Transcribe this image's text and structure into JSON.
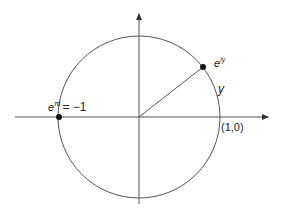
{
  "diagram": {
    "type": "unit-circle",
    "colors": {
      "stroke": "#555555",
      "point": "#111111",
      "text": "#222222"
    },
    "labels": {
      "point_eiy_base": "e",
      "point_eiy_exp": "iy",
      "arc_label": "y",
      "unit_point": "(1,0)",
      "point_neg1_base": "e",
      "point_neg1_exp": "πi",
      "point_neg1_value": "= −1"
    },
    "geometry": {
      "center": [
        139,
        117
      ],
      "radius": 81,
      "angle_deg": 35
    }
  }
}
